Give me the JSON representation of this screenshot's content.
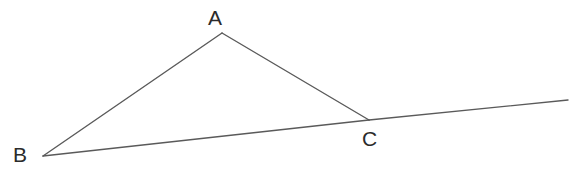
{
  "figure": {
    "kind": "geometry-diagram",
    "width": 584,
    "height": 174,
    "background_color": "#ffffff",
    "stroke_color": "#5a5a5a",
    "stroke_width": 1.4,
    "label_color": "#2b2b2b",
    "label_font_size": 21
  },
  "points": {
    "A": {
      "label": "A",
      "x": 222,
      "y": 33,
      "label_x": 208,
      "label_y": 7
    },
    "B": {
      "label": "B",
      "x": 43,
      "y": 156,
      "label_x": 13,
      "label_y": 144
    },
    "C": {
      "label": "C",
      "x": 369,
      "y": 120,
      "label_x": 362,
      "label_y": 128
    },
    "D": {
      "label": "",
      "x": 568,
      "y": 100,
      "label_x": 0,
      "label_y": 0
    }
  },
  "segments": [
    {
      "name": "side-AB",
      "from": "A",
      "to": "B",
      "x1": 222,
      "y1": 33,
      "x2": 43,
      "y2": 156
    },
    {
      "name": "side-AC",
      "from": "A",
      "to": "C",
      "x1": 222,
      "y1": 33,
      "x2": 369,
      "y2": 120
    },
    {
      "name": "side-BC",
      "from": "B",
      "to": "C",
      "x1": 43,
      "y1": 156,
      "x2": 369,
      "y2": 120
    },
    {
      "name": "ray-CD",
      "from": "C",
      "to": "D",
      "x1": 369,
      "y1": 120,
      "x2": 568,
      "y2": 100
    }
  ],
  "chart_data": {
    "type": "scatter",
    "title": "",
    "xlabel": "",
    "ylabel": "",
    "xlim": [
      0,
      584
    ],
    "ylim": [
      0,
      174
    ],
    "grid": false,
    "legend": null,
    "annotations": [
      "A",
      "B",
      "C"
    ],
    "categories": [
      "A",
      "B",
      "C",
      "D"
    ],
    "series": [
      {
        "name": "vertices",
        "x": [
          222,
          43,
          369,
          568
        ],
        "y": [
          33,
          156,
          120,
          100
        ]
      }
    ],
    "edges": [
      [
        "A",
        "B"
      ],
      [
        "A",
        "C"
      ],
      [
        "B",
        "C"
      ],
      [
        "C",
        "D"
      ]
    ]
  }
}
